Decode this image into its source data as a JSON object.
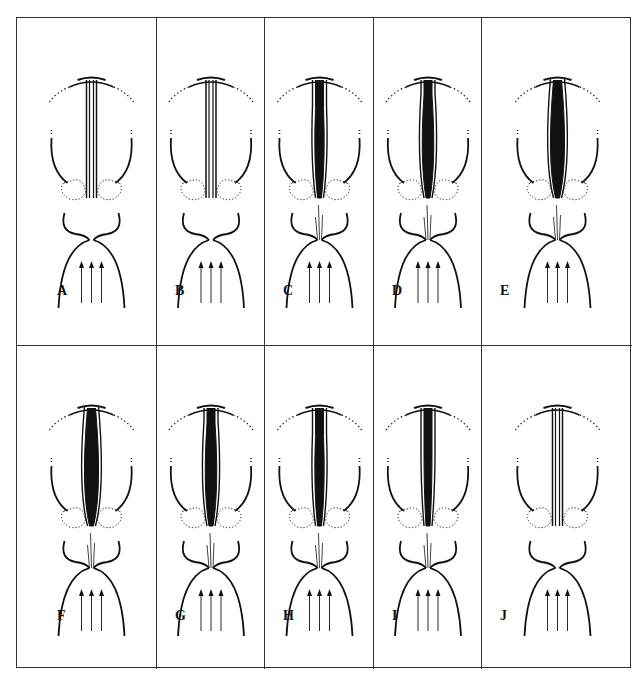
{
  "figure": {
    "panels": [
      {
        "label": "A",
        "row": 0,
        "col": 0,
        "glottis": "closed",
        "fold_fill": 0,
        "airflow": "closed",
        "jet": false
      },
      {
        "label": "B",
        "row": 0,
        "col": 1,
        "glottis": "closed",
        "fold_fill": 0,
        "airflow": "closed",
        "jet": false
      },
      {
        "label": "C",
        "row": 0,
        "col": 2,
        "glottis": "opening",
        "fold_fill": 0.45,
        "airflow": "open",
        "jet": true
      },
      {
        "label": "D",
        "row": 0,
        "col": 3,
        "glottis": "opening",
        "fold_fill": 0.7,
        "airflow": "open",
        "jet": true
      },
      {
        "label": "E",
        "row": 0,
        "col": 4,
        "glottis": "open",
        "fold_fill": 1.0,
        "airflow": "open",
        "jet": true
      },
      {
        "label": "F",
        "row": 1,
        "col": 0,
        "glottis": "open",
        "fold_fill": 1.0,
        "airflow": "open",
        "jet": true
      },
      {
        "label": "G",
        "row": 1,
        "col": 1,
        "glottis": "closing",
        "fold_fill": 0.7,
        "airflow": "open",
        "jet": true
      },
      {
        "label": "H",
        "row": 1,
        "col": 2,
        "glottis": "closing",
        "fold_fill": 0.45,
        "airflow": "open",
        "jet": true
      },
      {
        "label": "I",
        "row": 1,
        "col": 3,
        "glottis": "closing",
        "fold_fill": 0.25,
        "airflow": "open",
        "jet": true
      },
      {
        "label": "J",
        "row": 1,
        "col": 4,
        "glottis": "closed",
        "fold_fill": 0,
        "airflow": "closed",
        "jet": false
      }
    ],
    "colors": {
      "ink": "#111111",
      "border": "#333333",
      "background": "#ffffff"
    }
  }
}
